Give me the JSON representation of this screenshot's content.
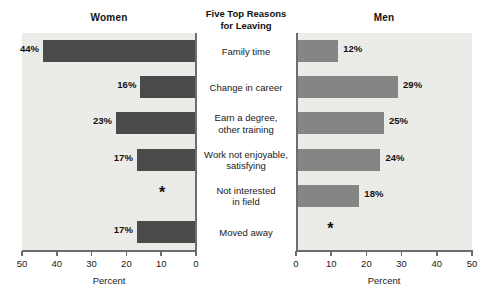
{
  "center_title": {
    "line1": "Five Top Reasons",
    "line2": "for Leaving"
  },
  "panels": {
    "left_header": "Women",
    "right_header": "Men"
  },
  "axis": {
    "title": "Percent",
    "left_ticks": [
      "50",
      "40",
      "30",
      "20",
      "10",
      "0"
    ],
    "right_ticks": [
      "0",
      "10",
      "20",
      "30",
      "40",
      "50"
    ]
  },
  "categories": [
    {
      "line1": "Family time",
      "line2": ""
    },
    {
      "line1": "Change in career",
      "line2": ""
    },
    {
      "line1": "Earn a degree,",
      "line2": "other training"
    },
    {
      "line1": "Work not enjoyable,",
      "line2": "satisfying"
    },
    {
      "line1": "Not interested",
      "line2": "in field"
    },
    {
      "line1": "Moved away",
      "line2": ""
    }
  ],
  "women_labels": [
    "44%",
    "16%",
    "23%",
    "17%",
    "*",
    "17%"
  ],
  "men_labels": [
    "12%",
    "29%",
    "25%",
    "24%",
    "18%",
    "*"
  ],
  "colors": {
    "women_bar": "#4a4a4a",
    "men_bar": "#858585",
    "panel_bg": "#ebebe8",
    "axis": "#6d6d6d"
  },
  "chart_data": {
    "type": "bar",
    "title": "Five Top Reasons for Leaving",
    "orientation": "horizontal",
    "layout": "back-to-back paired panels (Women mirrored left, Men right)",
    "categories": [
      "Family time",
      "Change in career",
      "Earn a degree, other training",
      "Work not enjoyable, satisfying",
      "Not interested in field",
      "Moved away"
    ],
    "series": [
      {
        "name": "Women",
        "values": [
          44,
          16,
          23,
          17,
          null,
          17
        ],
        "data_labels": [
          "44%",
          "16%",
          "23%",
          "17%",
          "*",
          "17%"
        ],
        "panel": "left",
        "direction": "right-to-left",
        "color": "#4a4a4a"
      },
      {
        "name": "Men",
        "values": [
          12,
          29,
          25,
          24,
          18,
          null
        ],
        "data_labels": [
          "12%",
          "29%",
          "25%",
          "24%",
          "18%",
          "*"
        ],
        "panel": "right",
        "direction": "left-to-right",
        "color": "#858585"
      }
    ],
    "xlabel": "Percent",
    "ylabel": "",
    "xlim": [
      0,
      50
    ],
    "xticks": [
      0,
      10,
      20,
      30,
      40,
      50
    ],
    "grid": false,
    "legend": "none (panel headers used instead)"
  }
}
